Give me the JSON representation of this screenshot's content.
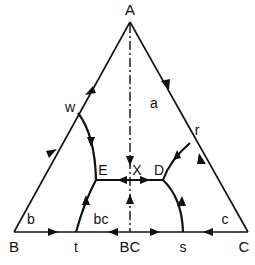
{
  "diagram": {
    "type": "ternary-phase-diagram",
    "vertices": {
      "A": {
        "label": "A",
        "x": 130,
        "y": 22,
        "label_x": 130,
        "label_y": 15
      },
      "B": {
        "label": "B",
        "x": 14,
        "y": 232,
        "label_x": 14,
        "label_y": 252
      },
      "C": {
        "label": "C",
        "x": 248,
        "y": 232,
        "label_x": 244,
        "label_y": 252
      }
    },
    "points": {
      "w": {
        "label": "w",
        "x": 78,
        "y": 113,
        "label_x": 70,
        "label_y": 112
      },
      "r": {
        "label": "r",
        "x": 190,
        "y": 143,
        "label_x": 197,
        "label_y": 135
      },
      "E": {
        "label": "E",
        "x": 96,
        "y": 180,
        "label_x": 103,
        "label_y": 175
      },
      "D": {
        "label": "D",
        "x": 163,
        "y": 180,
        "label_x": 159,
        "label_y": 175
      },
      "X": {
        "label": "X",
        "x": 130,
        "y": 180,
        "label_x": 137,
        "label_y": 175
      },
      "t": {
        "label": "t",
        "x": 76,
        "y": 232,
        "label_x": 76,
        "label_y": 252
      },
      "BC": {
        "label": "BC",
        "x": 130,
        "y": 232,
        "label_x": 130,
        "label_y": 252
      },
      "s": {
        "label": "s",
        "x": 183,
        "y": 232,
        "label_x": 183,
        "label_y": 252
      }
    },
    "region_labels": {
      "a": {
        "label": "a",
        "x": 154,
        "y": 108
      },
      "b": {
        "label": "b",
        "x": 31,
        "y": 224
      },
      "bc": {
        "label": "bc",
        "x": 101,
        "y": 224
      },
      "c": {
        "label": "c",
        "x": 225,
        "y": 224
      }
    },
    "colors": {
      "ink": "#111111",
      "background": "#ffffff"
    }
  }
}
